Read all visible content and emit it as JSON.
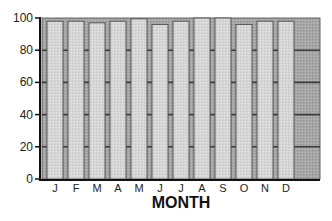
{
  "chart_data": {
    "type": "bar",
    "title": "",
    "xlabel": "MONTH",
    "ylabel": "",
    "categories": [
      "J",
      "F",
      "M",
      "A",
      "M",
      "J",
      "J",
      "A",
      "S",
      "O",
      "N",
      "D"
    ],
    "values": [
      98,
      98,
      97,
      98,
      99.5,
      96,
      98,
      100,
      100,
      96,
      98,
      98
    ],
    "ylim": [
      0,
      100
    ],
    "yticks": [
      0,
      20,
      40,
      60,
      80,
      100
    ],
    "grid": true,
    "legend": null
  },
  "colors": {
    "plot_background": "#a8a8a8",
    "bar_fill": "#d4d4d4",
    "bar_outline": "#555555",
    "gridline": "#3a3a3a",
    "axis": "#111111"
  }
}
